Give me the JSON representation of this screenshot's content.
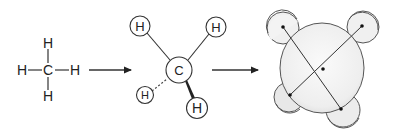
{
  "diagram": {
    "colors": {
      "line": "#333333",
      "circle_fill": "#ffffff",
      "blob_fill": "#ededed",
      "blob_stroke": "#555555"
    },
    "structural_formula": {
      "center_atom": "C",
      "atoms": [
        "H",
        "H",
        "H",
        "H"
      ]
    },
    "ball_and_stick": {
      "center_atom": "C",
      "atoms": [
        "H",
        "H",
        "H",
        "H"
      ],
      "bond_styles": [
        "plain",
        "plain",
        "dashed",
        "wedge"
      ]
    },
    "space_filling": {
      "label": "space-filling model"
    },
    "arrows": [
      "structural-to-ball-and-stick",
      "ball-and-stick-to-space-filling"
    ]
  }
}
